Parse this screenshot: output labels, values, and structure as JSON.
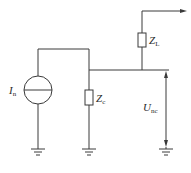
{
  "diagram": {
    "type": "circuit",
    "components": {
      "current_source": {
        "symbol": "I",
        "subscript": "n"
      },
      "impedance_c": {
        "symbol": "Z",
        "subscript": "c"
      },
      "impedance_l": {
        "symbol": "Z",
        "subscript": "L"
      },
      "voltage": {
        "symbol": "U",
        "subscript": "nc"
      }
    },
    "grounds": 3,
    "colors": {
      "line": "#3a3a3a",
      "text": "#2a2a2a",
      "background": "#ffffff"
    }
  }
}
